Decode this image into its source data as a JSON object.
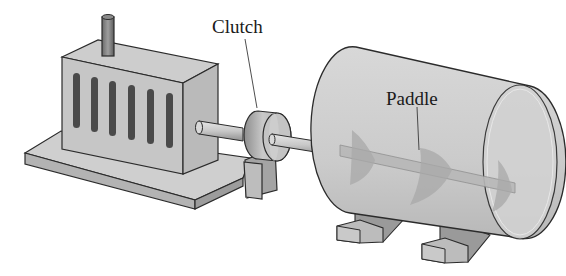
{
  "diagram": {
    "type": "mechanical-illustration",
    "components": [
      {
        "id": "motor",
        "description": "box-shaped motor with vertical vent slots and top exhaust pipe on a base plate"
      },
      {
        "id": "shaft",
        "description": "horizontal drive shaft from motor through clutch into tank"
      },
      {
        "id": "clutch",
        "description": "disc clutch on shaft mounted on a pedestal support"
      },
      {
        "id": "tank",
        "description": "transparent cylindrical mixing tank on two feet"
      },
      {
        "id": "paddle",
        "description": "helical paddle blades along the shaft inside the tank"
      }
    ],
    "labels": {
      "clutch": "Clutch",
      "paddle": "Paddle"
    },
    "colors": {
      "outline": "#2b2b2b",
      "body_light": "#d4d4d4",
      "body_mid": "#bdbdbd",
      "body_dark": "#9a9a9a",
      "slot": "#4a4a4a",
      "tank_fill": "#cfcfcf"
    }
  }
}
